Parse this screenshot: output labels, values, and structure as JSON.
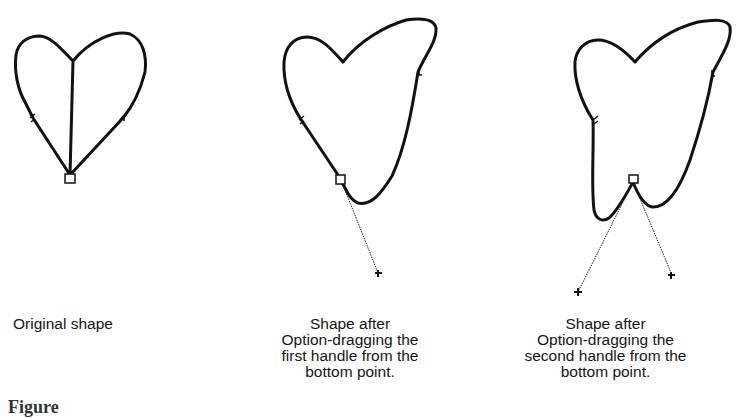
{
  "figure": {
    "panels": [
      {
        "id": "original",
        "caption": "Original shape"
      },
      {
        "id": "first-handle",
        "caption": "Shape after\nOption-dragging the\nfirst handle from the\nbottom point."
      },
      {
        "id": "second-handle",
        "caption": "Shape after\nOption-dragging the\nsecond handle from the\nbottom point."
      }
    ],
    "figure_caption_partial": "Figure"
  },
  "colors": {
    "stroke": "#111111",
    "background": "#ffffff"
  }
}
